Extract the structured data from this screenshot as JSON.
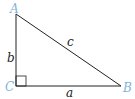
{
  "diagram": {
    "type": "right-triangle",
    "colors": {
      "line": "#222222",
      "vertex_label": "#7fb3d9",
      "side_label": "#222222"
    },
    "vertices": [
      {
        "name": "A",
        "x": 16,
        "y": 14
      },
      {
        "name": "B",
        "x": 121,
        "y": 86
      },
      {
        "name": "C",
        "x": 16,
        "y": 86
      }
    ],
    "sides": [
      {
        "name": "a",
        "from": "C",
        "to": "B"
      },
      {
        "name": "b",
        "from": "A",
        "to": "C"
      },
      {
        "name": "c",
        "from": "A",
        "to": "B"
      }
    ],
    "right_angle_at": "C",
    "labels": {
      "A": "A",
      "B": "B",
      "C": "C",
      "a": "a",
      "b": "b",
      "c": "c"
    }
  }
}
